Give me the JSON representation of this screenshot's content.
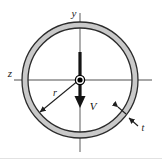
{
  "figure": {
    "background_color": "#ffffff",
    "bottom_rule_color": "#d9d9d9"
  },
  "labels": {
    "y_axis": "y",
    "z_axis": "z",
    "radius": "r",
    "thickness": "t",
    "shear_force": "V"
  },
  "geometry": {
    "center_x": 80,
    "center_y": 80,
    "mean_radius": 55,
    "wall_thickness": 5,
    "y_axis_top": 13,
    "y_axis_bottom": 152,
    "z_axis_left": 14,
    "z_axis_right": 152,
    "force_arrow_top": 52,
    "force_arrow_bottom": 106,
    "radius_arrow_end_x": 38,
    "radius_arrow_end_y": 114
  },
  "colors": {
    "ring_fill": "#c9c9c9",
    "ring_stroke": "#2b2b2b",
    "axis_line": "#8a8a8a",
    "arrow": "#141414",
    "center_dot": "#000000",
    "leader_line": "#1f1f1f"
  }
}
